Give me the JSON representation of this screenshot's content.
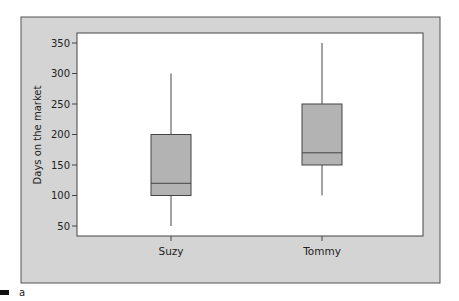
{
  "chart_data": {
    "type": "box",
    "title": "",
    "xlabel": "",
    "ylabel": "Days on the market",
    "ylim": [
      33,
      368
    ],
    "yticks": [
      50,
      100,
      150,
      200,
      250,
      300,
      350
    ],
    "categories": [
      "Suzy",
      "Tommy"
    ],
    "series": [
      {
        "name": "Suzy",
        "min": 50,
        "q1": 100,
        "median": 120,
        "q3": 200,
        "max": 300
      },
      {
        "name": "Tommy",
        "min": 100,
        "q1": 150,
        "median": 170,
        "q3": 250,
        "max": 350
      }
    ],
    "grid": false,
    "legend": "none",
    "panel_label": "a"
  },
  "colors": {
    "frame_bg": "#d4d4d4",
    "plot_bg": "#ffffff",
    "box_fill": "#b3b3b3",
    "line": "#444444"
  }
}
